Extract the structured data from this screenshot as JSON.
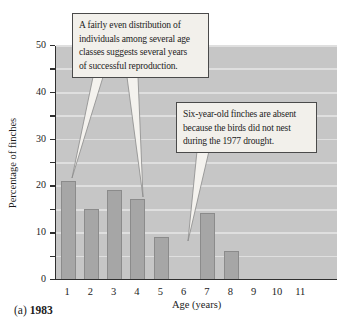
{
  "panel": {
    "label": "(a)",
    "year": "1983"
  },
  "callouts": [
    {
      "text": "A fairly even distribution of individuals among several age classes suggests several years of successful reproduction.",
      "lines": [
        "A fairly even distribution of",
        "individuals among several age",
        "classes suggests several years",
        "of successful reproduction."
      ]
    },
    {
      "text": "Six-year-old finches are absent because the birds did not nest during the 1977 drought.",
      "lines": [
        "Six-year-old finches are absent",
        "because the birds did not nest",
        "during the 1977 drought."
      ]
    }
  ],
  "chart_data": {
    "type": "bar",
    "title": "",
    "xlabel": "Age (years)",
    "ylabel": "Percentage of finches",
    "categories": [
      "1",
      "2",
      "3",
      "4",
      "5",
      "6",
      "7",
      "8",
      "9",
      "10",
      "11"
    ],
    "values": [
      21,
      15,
      19,
      17,
      9,
      0,
      14,
      6,
      0,
      0,
      0
    ],
    "ylim": [
      0,
      50
    ],
    "yticks_labeled": [
      0,
      10,
      20,
      30,
      40,
      50
    ],
    "ytick_minor_step": 5,
    "grid": true,
    "legend": "none",
    "colors": {
      "plot_bg": "#c6c6c6",
      "gridline": "#dfdfdf",
      "bar_fill": "#a6a6a6",
      "bar_border": "#8b8b8b",
      "axis": "#2f2f2f",
      "callout_bg": "#f2f0eb",
      "callout_border": "#4a4a4a",
      "text": "#1c1c1c"
    }
  }
}
